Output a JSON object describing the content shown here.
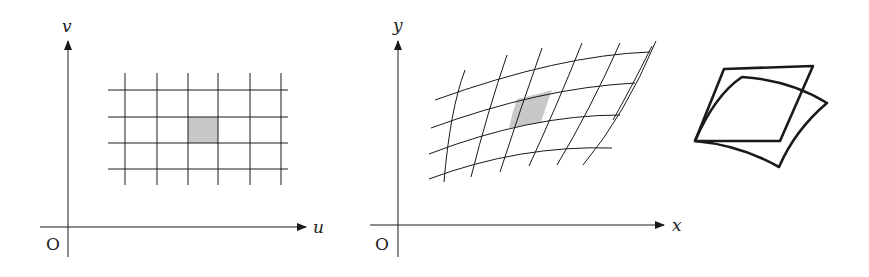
{
  "figure": {
    "panels": [
      {
        "id": "uv-plane",
        "axes": {
          "horizontal_label": "u",
          "vertical_label": "v",
          "origin_label": "O"
        },
        "grid": {
          "type": "rectangular",
          "vertical_lines": 6,
          "horizontal_lines": 4,
          "shaded_cell": "row 2, col 3"
        }
      },
      {
        "id": "xy-plane",
        "axes": {
          "horizontal_label": "x",
          "vertical_label": "y",
          "origin_label": "O"
        },
        "grid": {
          "type": "curvilinear (image of uv grid)",
          "vertical_curves": 7,
          "horizontal_curves": 4,
          "shaded_cell": "curved parallelogram image of shaded rectangle"
        }
      },
      {
        "id": "area-comparison",
        "shapes": [
          "parallelogram (linear approximation)",
          "curved region (actual image)"
        ]
      }
    ],
    "colors": {
      "stroke": "#1a1a1a",
      "shade": "#c8c8c8"
    }
  }
}
